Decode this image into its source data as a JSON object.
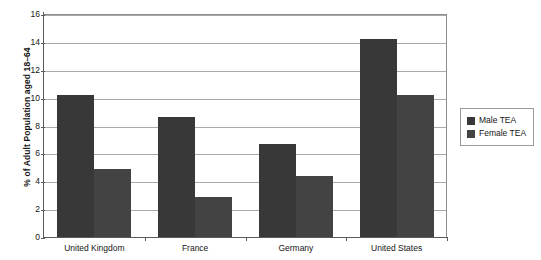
{
  "chart_data": {
    "type": "bar",
    "title": "",
    "xlabel": "",
    "ylabel": "% of Adult Population aged 18–64",
    "categories": [
      "United Kingdom",
      "France",
      "Germany",
      "United States"
    ],
    "series": [
      {
        "name": "Male TEA",
        "color": "#383838",
        "values": [
          10.2,
          8.6,
          6.7,
          14.2
        ]
      },
      {
        "name": "Female TEA",
        "color": "#434343",
        "values": [
          4.9,
          2.9,
          4.4,
          10.2
        ]
      }
    ],
    "ylim": [
      0,
      16
    ],
    "ytick_step": 2,
    "yticks": [
      0,
      2,
      4,
      6,
      8,
      10,
      12,
      14,
      16
    ],
    "ytick_labels": [
      "0",
      "2",
      "4",
      "6",
      "8",
      "10",
      "12",
      "14",
      "16"
    ],
    "grid": {
      "horizontal": true,
      "vertical": false,
      "color": "#a9a9a9"
    },
    "legend": {
      "position": "right-outside",
      "entries": [
        {
          "label": "Male TEA",
          "swatch_color": "#383838"
        },
        {
          "label": "Female TEA",
          "swatch_color": "#434343"
        }
      ]
    },
    "axis_color": "#5a5a5a",
    "plot_background": "#ffffff"
  }
}
